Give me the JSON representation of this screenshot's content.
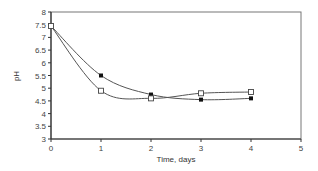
{
  "chart_data": {
    "type": "line",
    "title": "",
    "xlabel": "Time, days",
    "ylabel": "pH",
    "xlim": [
      0,
      5
    ],
    "ylim": [
      3,
      8
    ],
    "x_ticks": [
      "0",
      "1",
      "2",
      "3",
      "4",
      "5"
    ],
    "y_ticks": [
      "3",
      "3.5",
      "4",
      "4.5",
      "5",
      "5.5",
      "6",
      "6.5",
      "7",
      "7.5",
      "8"
    ],
    "grid": false,
    "legend": null,
    "series": [
      {
        "name": "filled-diamond",
        "marker": "filled",
        "smoothed_curve": true,
        "x": [
          0,
          1,
          2,
          3,
          4
        ],
        "values": [
          7.45,
          5.5,
          4.75,
          4.55,
          4.6
        ]
      },
      {
        "name": "open-square",
        "marker": "open",
        "smoothed_curve": true,
        "x": [
          0,
          1,
          2,
          3,
          4
        ],
        "values": [
          7.45,
          4.9,
          4.6,
          4.8,
          4.85
        ]
      }
    ]
  }
}
